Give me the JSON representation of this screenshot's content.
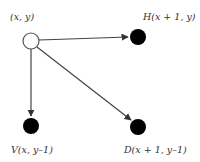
{
  "diagram": {
    "colors": {
      "edge": "#444444",
      "filled_node": "#000000",
      "open_node_fill": "#ffffff",
      "open_node_stroke": "#555555",
      "label": "#333333"
    },
    "nodes": [
      {
        "id": "origin",
        "label": "(x, y)",
        "cx": 31,
        "cy": 41,
        "r": 8,
        "filled": false,
        "label_x": 10,
        "label_y": 20
      },
      {
        "id": "H",
        "label": "H(x + 1, y)",
        "cx": 138,
        "cy": 37,
        "r": 8,
        "filled": true,
        "label_x": 143,
        "label_y": 20
      },
      {
        "id": "V",
        "label": "V(x, y–1)",
        "cx": 31,
        "cy": 126,
        "r": 8,
        "filled": true,
        "label_x": 11,
        "label_y": 153
      },
      {
        "id": "D",
        "label": "D(x + 1, y–1)",
        "cx": 138,
        "cy": 127,
        "r": 8,
        "filled": true,
        "label_x": 124,
        "label_y": 153
      }
    ],
    "edges": [
      {
        "from": "origin",
        "to": "H"
      },
      {
        "from": "origin",
        "to": "V"
      },
      {
        "from": "origin",
        "to": "D"
      }
    ]
  }
}
